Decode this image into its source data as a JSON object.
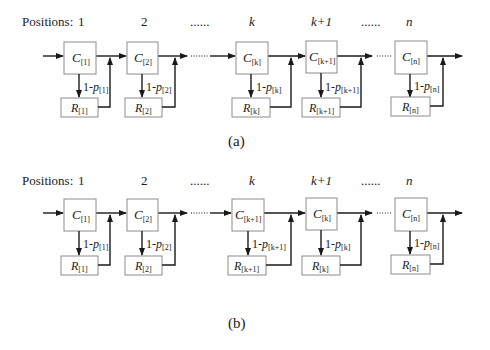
{
  "diagram_a": {
    "caption": "(a)",
    "positions_label": "Positions:",
    "positions": [
      "1",
      "2",
      "......",
      "k",
      "k+1",
      "......",
      "n"
    ],
    "stages": [
      {
        "c_main": "C",
        "c_sub": "[1]",
        "r_main": "R",
        "r_sub": "[1]",
        "p_prefix": "1-",
        "p_main": "p",
        "p_sub": "[1]"
      },
      {
        "c_main": "C",
        "c_sub": "[2]",
        "r_main": "R",
        "r_sub": "[2]",
        "p_prefix": "1-",
        "p_main": "p",
        "p_sub": "[2]"
      },
      {
        "c_main": "C",
        "c_sub": "[k]",
        "r_main": "R",
        "r_sub": "[k]",
        "p_prefix": "1-",
        "p_main": "p",
        "p_sub": "[k]"
      },
      {
        "c_main": "C",
        "c_sub": "[k+1]",
        "r_main": "R",
        "r_sub": "[k+1]",
        "p_prefix": "1-",
        "p_main": "p",
        "p_sub": "[k+1]"
      },
      {
        "c_main": "C",
        "c_sub": "[n]",
        "r_main": "R",
        "r_sub": "[n]",
        "p_prefix": "1-",
        "p_main": "p",
        "p_sub": "[n]"
      }
    ],
    "ellipsis": "......"
  },
  "diagram_b": {
    "caption": "(b)",
    "positions_label": "Positions:",
    "positions": [
      "1",
      "2",
      "......",
      "k",
      "k+1",
      "......",
      "n"
    ],
    "stages": [
      {
        "c_main": "C",
        "c_sub": "[1]",
        "r_main": "R",
        "r_sub": "[1]",
        "p_prefix": "1-",
        "p_main": "p",
        "p_sub": "[1]"
      },
      {
        "c_main": "C",
        "c_sub": "[2]",
        "r_main": "R",
        "r_sub": "[2]",
        "p_prefix": "1-",
        "p_main": "p",
        "p_sub": "[2]"
      },
      {
        "c_main": "C",
        "c_sub": "[k+1]",
        "r_main": "R",
        "r_sub": "[k+1]",
        "p_prefix": "1-",
        "p_main": "p",
        "p_sub": "[k+1]"
      },
      {
        "c_main": "C",
        "c_sub": "[k]",
        "r_main": "R",
        "r_sub": "[k]",
        "p_prefix": "1-",
        "p_main": "p",
        "p_sub": "[k]"
      },
      {
        "c_main": "C",
        "c_sub": "[n]",
        "r_main": "R",
        "r_sub": "[n]",
        "p_prefix": "1-",
        "p_main": "p",
        "p_sub": "[n]"
      }
    ],
    "ellipsis": "......"
  }
}
